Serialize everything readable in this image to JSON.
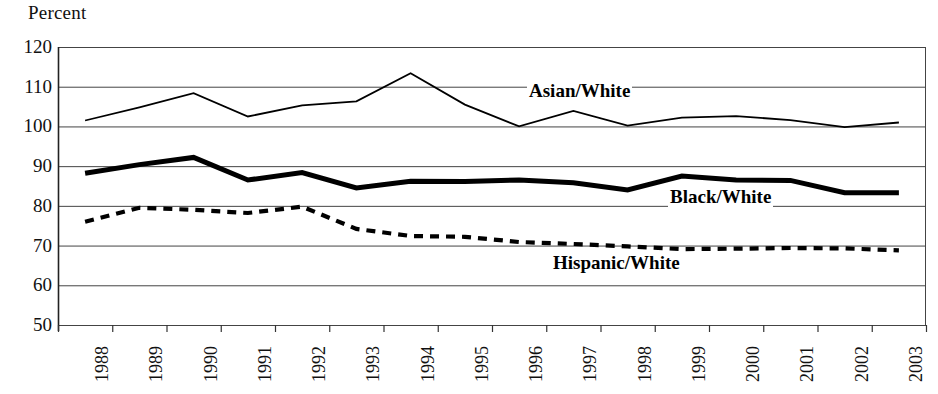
{
  "chart_data": {
    "type": "line",
    "title": "",
    "ylabel": "Percent",
    "xlabel": "",
    "ylim": [
      50,
      120
    ],
    "yticks": [
      50,
      60,
      70,
      80,
      90,
      100,
      110,
      120
    ],
    "grid": true,
    "legend": "inline-labels",
    "categories": [
      "1988",
      "1989",
      "1990",
      "1991",
      "1992",
      "1993",
      "1994",
      "1995",
      "1996",
      "1997",
      "1998",
      "1999",
      "2000",
      "2001",
      "2002",
      "2003"
    ],
    "series": [
      {
        "name": "Asian/White",
        "style": "solid-thin",
        "color": "#000000",
        "values": [
          101.5,
          104.8,
          108.4,
          102.5,
          105.3,
          106.3,
          113.4,
          105.5,
          100.0,
          103.9,
          100.2,
          102.2,
          102.6,
          101.6,
          99.8,
          101.0
        ]
      },
      {
        "name": "Black/White",
        "style": "solid-thick",
        "color": "#000000",
        "values": [
          88.2,
          90.4,
          92.2,
          86.5,
          88.4,
          84.5,
          86.2,
          86.1,
          86.5,
          85.8,
          84.0,
          87.5,
          86.5,
          86.4,
          83.3,
          83.3
        ]
      },
      {
        "name": "Hispanic/White",
        "style": "dashed",
        "color": "#000000",
        "values": [
          76.0,
          79.5,
          79.0,
          78.2,
          79.8,
          74.2,
          72.4,
          72.2,
          70.9,
          70.4,
          69.8,
          69.1,
          69.2,
          69.4,
          69.3,
          68.8
        ]
      }
    ]
  },
  "labels": {
    "percent": "Percent",
    "asian_white": "Asian/White",
    "black_white": "Black/White",
    "hispanic_white": "Hispanic/White"
  }
}
